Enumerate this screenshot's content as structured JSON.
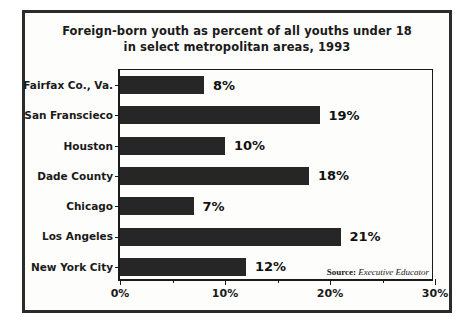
{
  "chart_data": {
    "type": "bar",
    "orientation": "horizontal",
    "title": "Foreign-born youth as percent of all youths under 18 in select metropolitan areas, 1993",
    "title_lines": [
      "Foreign-born youth as percent of all youths under 18",
      "in select metropolitan areas, 1993"
    ],
    "categories": [
      "Fairfax Co., Va.",
      "San Franscieco",
      "Houston",
      "Dade County",
      "Chicago",
      "Los Angeles",
      "New York City"
    ],
    "values": [
      8,
      19,
      10,
      18,
      7,
      21,
      12
    ],
    "value_labels": [
      "8%",
      "19%",
      "10%",
      "18%",
      "7%",
      "21%",
      "12%"
    ],
    "xlabel": "",
    "ylabel": "",
    "xlim": [
      0,
      30
    ],
    "xticks": [
      0,
      10,
      20,
      30
    ],
    "xtick_labels": [
      "0%",
      "10%",
      "20%",
      "30%"
    ],
    "xtick_minor": [
      5,
      15,
      25
    ],
    "grid": false,
    "legend": null,
    "bar_color": "#262626",
    "units": "percent"
  },
  "source": {
    "prefix": "Source:",
    "publication": "Executive Educator"
  }
}
